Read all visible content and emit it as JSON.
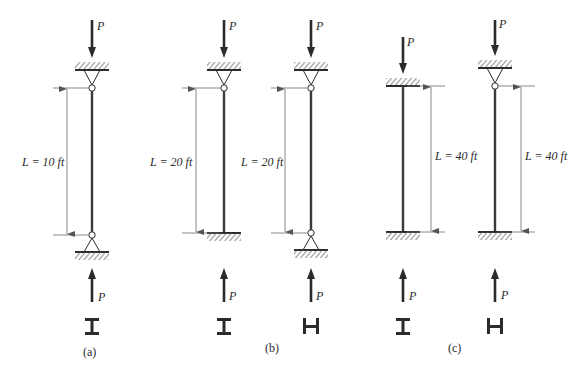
{
  "figure": {
    "top_fragment_text": "",
    "load_symbol": "P",
    "colors": {
      "ink": "#2b2b2b",
      "dim": "#6a6a6a",
      "hatch": "#555555",
      "bg": "#ffffff"
    }
  },
  "columns": [
    {
      "id": "a1",
      "x": 92,
      "top_support": "pin",
      "bottom_support": "pin",
      "top_y": 88,
      "bottom_y": 235,
      "length_label": "L = 10 ft",
      "dim_side": "left",
      "dim_x": 67,
      "section": "I",
      "load_top_y": 20
    },
    {
      "id": "b1",
      "x": 224,
      "top_support": "pin",
      "bottom_support": "fixed",
      "top_y": 88,
      "bottom_y": 233,
      "length_label": "L = 20 ft",
      "dim_side": "left",
      "dim_x": 196,
      "section": "I",
      "load_top_y": 20
    },
    {
      "id": "b2",
      "x": 311,
      "top_support": "pin",
      "bottom_support": "pin",
      "top_y": 88,
      "bottom_y": 233,
      "length_label": "L = 20 ft",
      "dim_side": "left",
      "dim_x": 285,
      "section": "H",
      "load_top_y": 20
    },
    {
      "id": "c1",
      "x": 403,
      "top_support": "fixed",
      "bottom_support": "fixed",
      "top_y": 86,
      "bottom_y": 232,
      "length_label": "L = 40 ft",
      "dim_side": "right",
      "dim_x": 431,
      "section": "I",
      "load_top_y": 37
    },
    {
      "id": "c2",
      "x": 495,
      "top_support": "pin",
      "bottom_support": "fixed",
      "top_y": 86,
      "bottom_y": 232,
      "length_label": "L = 40 ft",
      "dim_side": "right",
      "dim_x": 521,
      "section": "H",
      "load_top_y": 20
    }
  ],
  "group_labels": [
    {
      "text": "(a)",
      "x": 92,
      "y": 356
    },
    {
      "text": "(b)",
      "x": 273,
      "y": 352
    },
    {
      "text": "(c)",
      "x": 456,
      "y": 352
    }
  ],
  "labels": {
    "a1_L": "L = 10 ft",
    "b1_L": "L = 20 ft",
    "b2_L": "L = 20 ft",
    "c1_L": "L = 40 ft",
    "c2_L": "L = 40 ft",
    "P": "P",
    "group_a": "(a)",
    "group_b": "(b)",
    "group_c": "(c)"
  }
}
